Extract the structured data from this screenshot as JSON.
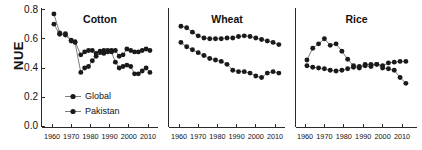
{
  "figure": {
    "ylabel": "NUE",
    "y_ticks": [
      "0.0",
      "0.2",
      "0.4",
      "0.6",
      "0.8"
    ],
    "x_ticks": [
      "1960",
      "1970",
      "1980",
      "1990",
      "2000",
      "2010"
    ],
    "legend": {
      "items": [
        "Global",
        "Pakistan"
      ]
    },
    "panel_titles": [
      "Cotton",
      "Wheat",
      "Rice"
    ],
    "marker_color": "#1a1a1a",
    "line_color": "#6f6f6f",
    "axis_color": "#2a2a2a"
  },
  "chart_data": [
    {
      "type": "line",
      "title": "Cotton",
      "xlabel": "",
      "ylabel": "NUE",
      "xlim": [
        1958,
        2014
      ],
      "ylim": [
        0.0,
        0.8
      ],
      "grid": false,
      "legend_position": "lower-left (panel 1)",
      "series": [
        {
          "name": "Global",
          "x": [
            1961,
            1964,
            1967,
            1970,
            1972,
            1975,
            1977,
            1979,
            1981,
            1983,
            1985,
            1987,
            1989,
            1991,
            1993,
            1995,
            1997,
            1999,
            2001,
            2003,
            2005,
            2007,
            2009,
            2011
          ],
          "y": [
            0.77,
            0.64,
            0.635,
            0.59,
            0.58,
            0.49,
            0.51,
            0.52,
            0.52,
            0.5,
            0.505,
            0.52,
            0.51,
            0.52,
            0.52,
            0.48,
            0.49,
            0.53,
            0.52,
            0.51,
            0.51,
            0.52,
            0.53,
            0.52
          ]
        },
        {
          "name": "Pakistan",
          "x": [
            1961,
            1964,
            1967,
            1970,
            1972,
            1975,
            1977,
            1979,
            1981,
            1983,
            1985,
            1987,
            1989,
            1991,
            1993,
            1995,
            1997,
            1999,
            2001,
            2003,
            2005,
            2007,
            2009,
            2011
          ],
          "y": [
            0.7,
            0.63,
            0.625,
            0.585,
            0.575,
            0.37,
            0.4,
            0.41,
            0.45,
            0.48,
            0.515,
            0.5,
            0.52,
            0.51,
            0.44,
            0.4,
            0.41,
            0.42,
            0.41,
            0.36,
            0.36,
            0.38,
            0.4,
            0.37
          ]
        }
      ]
    },
    {
      "type": "line",
      "title": "Wheat",
      "xlabel": "",
      "ylabel": "NUE",
      "xlim": [
        1958,
        2014
      ],
      "ylim": [
        0.0,
        0.8
      ],
      "grid": false,
      "series": [
        {
          "name": "Global",
          "x": [
            1961,
            1964,
            1967,
            1970,
            1973,
            1976,
            1979,
            1982,
            1985,
            1988,
            1991,
            1994,
            1997,
            2000,
            2003,
            2006,
            2009,
            2012
          ],
          "y": [
            0.685,
            0.675,
            0.645,
            0.62,
            0.605,
            0.6,
            0.6,
            0.6,
            0.605,
            0.605,
            0.615,
            0.62,
            0.615,
            0.605,
            0.595,
            0.585,
            0.575,
            0.56
          ]
        },
        {
          "name": "Pakistan",
          "x": [
            1961,
            1964,
            1967,
            1970,
            1973,
            1976,
            1979,
            1982,
            1985,
            1988,
            1991,
            1994,
            1997,
            2000,
            2003,
            2006,
            2009,
            2012
          ],
          "y": [
            0.575,
            0.545,
            0.525,
            0.505,
            0.485,
            0.465,
            0.455,
            0.445,
            0.425,
            0.385,
            0.375,
            0.375,
            0.365,
            0.345,
            0.335,
            0.365,
            0.375,
            0.365
          ]
        }
      ]
    },
    {
      "type": "line",
      "title": "Rice",
      "xlabel": "",
      "ylabel": "NUE",
      "xlim": [
        1958,
        2014
      ],
      "ylim": [
        0.0,
        0.8
      ],
      "grid": false,
      "series": [
        {
          "name": "Global",
          "x": [
            1961,
            1964,
            1967,
            1970,
            1973,
            1976,
            1979,
            1982,
            1985,
            1988,
            1991,
            1994,
            1997,
            2000,
            2003,
            2006,
            2009,
            2012
          ],
          "y": [
            0.415,
            0.405,
            0.4,
            0.395,
            0.385,
            0.38,
            0.385,
            0.395,
            0.405,
            0.4,
            0.425,
            0.425,
            0.425,
            0.415,
            0.435,
            0.44,
            0.445,
            0.445
          ]
        },
        {
          "name": "Pakistan",
          "x": [
            1961,
            1964,
            1967,
            1970,
            1973,
            1976,
            1979,
            1982,
            1985,
            1988,
            1991,
            1994,
            1997,
            2000,
            2003,
            2006,
            2009,
            2012
          ],
          "y": [
            0.455,
            0.535,
            0.565,
            0.6,
            0.555,
            0.565,
            0.515,
            0.46,
            0.415,
            0.41,
            0.415,
            0.41,
            0.425,
            0.4,
            0.395,
            0.385,
            0.335,
            0.295
          ]
        }
      ]
    }
  ]
}
